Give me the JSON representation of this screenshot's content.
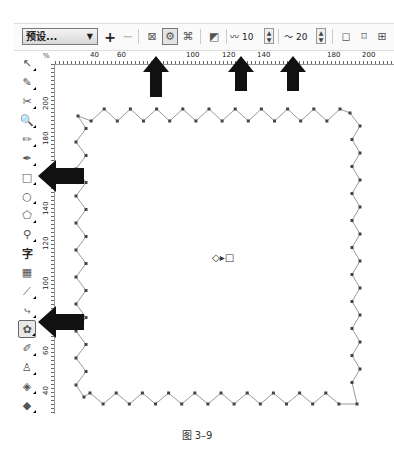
{
  "property_bar": {
    "preset_select": {
      "value": "预设...",
      "caret": "▼"
    },
    "add_preset": "+",
    "remove_preset": "−",
    "distortion_buttons": [
      {
        "name": "push-pull-distortion",
        "glyph": "⊠",
        "active": false
      },
      {
        "name": "zipper-distortion",
        "glyph": "⚙",
        "active": true
      },
      {
        "name": "twister-distortion",
        "glyph": "⌘",
        "active": false
      }
    ],
    "clear_distortion": "◩",
    "amplitude": {
      "icon": "〰",
      "value": "10"
    },
    "frequency": {
      "icon": "〜",
      "value": "20"
    },
    "spin_up": "▲",
    "spin_down": "▼",
    "effect_buttons": [
      {
        "name": "random-distortion",
        "glyph": "◻"
      },
      {
        "name": "smooth-distortion",
        "glyph": "⌑"
      },
      {
        "name": "local-distortion",
        "glyph": "⊞"
      }
    ]
  },
  "horizontal_ruler": {
    "unit": "%",
    "labels": [
      {
        "text": "40",
        "x": 90
      },
      {
        "text": "60",
        "x": 117
      },
      {
        "text": "100",
        "x": 186
      },
      {
        "text": "120",
        "x": 222
      },
      {
        "text": "140",
        "x": 257
      },
      {
        "text": "180",
        "x": 327
      },
      {
        "text": "200",
        "x": 362
      }
    ]
  },
  "vertical_ruler": {
    "labels": [
      {
        "text": "200",
        "y": 110
      },
      {
        "text": "180",
        "y": 145
      },
      {
        "text": "140",
        "y": 215
      },
      {
        "text": "120",
        "y": 250
      },
      {
        "text": "100",
        "y": 290
      },
      {
        "text": "60",
        "y": 355
      },
      {
        "text": "40",
        "y": 395
      }
    ]
  },
  "toolbox": {
    "tools": [
      {
        "name": "pick-tool",
        "glyph": "↖",
        "flyout": true,
        "active": false
      },
      {
        "name": "shape-tool",
        "glyph": "✎",
        "flyout": true,
        "active": false
      },
      {
        "name": "crop-tool",
        "glyph": "✂",
        "flyout": true,
        "active": false
      },
      {
        "name": "zoom-tool",
        "glyph": "🔍",
        "flyout": true,
        "active": false
      },
      {
        "name": "freehand-tool",
        "glyph": "✏",
        "flyout": true,
        "active": false
      },
      {
        "name": "smart-fill-tool",
        "glyph": "✒",
        "flyout": true,
        "active": false
      },
      {
        "name": "rectangle-tool",
        "glyph": "□",
        "flyout": true,
        "active": false
      },
      {
        "name": "ellipse-tool",
        "glyph": "○",
        "flyout": true,
        "active": false
      },
      {
        "name": "polygon-tool",
        "glyph": "⬠",
        "flyout": true,
        "active": false
      },
      {
        "name": "basic-shapes-tool",
        "glyph": "⚲",
        "flyout": true,
        "active": false
      },
      {
        "name": "text-tool",
        "glyph": "字",
        "flyout": false,
        "active": false
      },
      {
        "name": "table-tool",
        "glyph": "▦",
        "flyout": false,
        "active": false
      },
      {
        "name": "parallel-dimension-tool",
        "glyph": "⟋",
        "flyout": true,
        "active": false
      },
      {
        "name": "connector-tool",
        "glyph": "⤷",
        "flyout": true,
        "active": false
      },
      {
        "name": "distort-tool",
        "glyph": "✿",
        "flyout": true,
        "active": true
      },
      {
        "name": "eyedropper-tool",
        "glyph": "✐",
        "flyout": true,
        "active": false
      },
      {
        "name": "outline-pen-tool",
        "glyph": "♙",
        "flyout": true,
        "active": false
      },
      {
        "name": "fill-tool",
        "glyph": "◈",
        "flyout": true,
        "active": false
      },
      {
        "name": "interactive-fill-tool",
        "glyph": "◆",
        "flyout": true,
        "active": false
      }
    ]
  },
  "canvas": {
    "shape": "zipper-distorted-rectangle",
    "amplitude": 10,
    "frequency": 20,
    "center_handle": "◇▸□"
  },
  "annotations": [
    {
      "name": "arrow-up-zipper",
      "direction": "up",
      "x": 152,
      "y": 55
    },
    {
      "name": "arrow-up-amplitude",
      "direction": "up",
      "x": 241,
      "y": 55
    },
    {
      "name": "arrow-up-frequency",
      "direction": "up",
      "x": 293,
      "y": 55
    },
    {
      "name": "arrow-left-rectangle",
      "direction": "left",
      "x": 32,
      "y": 163
    },
    {
      "name": "arrow-left-distort",
      "direction": "left",
      "x": 32,
      "y": 310
    }
  ],
  "caption": "图 3–9"
}
